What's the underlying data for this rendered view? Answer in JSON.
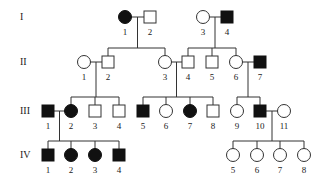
{
  "colors": {
    "affected": "#111111",
    "unaffected": "#ffffff",
    "line": "#333333"
  },
  "generations": [
    {
      "label": "I",
      "y": 17
    },
    {
      "label": "II",
      "y": 62
    },
    {
      "label": "III",
      "y": 111
    },
    {
      "label": "IV",
      "y": 155
    }
  ],
  "individuals": [
    {
      "id": "I-1",
      "num": "1",
      "gen": 0,
      "x": 125,
      "sex": "female",
      "affected": true
    },
    {
      "id": "I-2",
      "num": "2",
      "gen": 0,
      "x": 150,
      "sex": "male",
      "affected": false
    },
    {
      "id": "I-3",
      "num": "3",
      "gen": 0,
      "x": 203,
      "sex": "female",
      "affected": false
    },
    {
      "id": "I-4",
      "num": "4",
      "gen": 0,
      "x": 227,
      "sex": "male",
      "affected": true
    },
    {
      "id": "II-1",
      "num": "1",
      "gen": 1,
      "x": 84,
      "sex": "female",
      "affected": false
    },
    {
      "id": "II-2",
      "num": "2",
      "gen": 1,
      "x": 108,
      "sex": "male",
      "affected": false
    },
    {
      "id": "II-3",
      "num": "3",
      "gen": 1,
      "x": 165,
      "sex": "female",
      "affected": false
    },
    {
      "id": "II-4",
      "num": "4",
      "gen": 1,
      "x": 188,
      "sex": "male",
      "affected": false
    },
    {
      "id": "II-5",
      "num": "5",
      "gen": 1,
      "x": 212,
      "sex": "male",
      "affected": false
    },
    {
      "id": "II-6",
      "num": "6",
      "gen": 1,
      "x": 236,
      "sex": "female",
      "affected": false
    },
    {
      "id": "II-7",
      "num": "7",
      "gen": 1,
      "x": 260,
      "sex": "male",
      "affected": true
    },
    {
      "id": "III-1",
      "num": "1",
      "gen": 2,
      "x": 48,
      "sex": "male",
      "affected": true
    },
    {
      "id": "III-2",
      "num": "2",
      "gen": 2,
      "x": 71,
      "sex": "female",
      "affected": true
    },
    {
      "id": "III-3",
      "num": "3",
      "gen": 2,
      "x": 95,
      "sex": "male",
      "affected": false
    },
    {
      "id": "III-4",
      "num": "4",
      "gen": 2,
      "x": 119,
      "sex": "male",
      "affected": false
    },
    {
      "id": "III-5",
      "num": "5",
      "gen": 2,
      "x": 143,
      "sex": "male",
      "affected": true
    },
    {
      "id": "III-6",
      "num": "6",
      "gen": 2,
      "x": 166,
      "sex": "female",
      "affected": false
    },
    {
      "id": "III-7",
      "num": "7",
      "gen": 2,
      "x": 190,
      "sex": "female",
      "affected": true
    },
    {
      "id": "III-8",
      "num": "8",
      "gen": 2,
      "x": 213,
      "sex": "male",
      "affected": false
    },
    {
      "id": "III-9",
      "num": "9",
      "gen": 2,
      "x": 237,
      "sex": "female",
      "affected": false
    },
    {
      "id": "III-10",
      "num": "10",
      "gen": 2,
      "x": 260,
      "sex": "male",
      "affected": true
    },
    {
      "id": "III-11",
      "num": "11",
      "gen": 2,
      "x": 284,
      "sex": "female",
      "affected": false
    },
    {
      "id": "IV-1",
      "num": "1",
      "gen": 3,
      "x": 48,
      "sex": "male",
      "affected": true
    },
    {
      "id": "IV-2",
      "num": "2",
      "gen": 3,
      "x": 71,
      "sex": "female",
      "affected": true
    },
    {
      "id": "IV-3",
      "num": "3",
      "gen": 3,
      "x": 95,
      "sex": "female",
      "affected": true
    },
    {
      "id": "IV-4",
      "num": "4",
      "gen": 3,
      "x": 119,
      "sex": "male",
      "affected": true
    },
    {
      "id": "IV-5",
      "num": "5",
      "gen": 3,
      "x": 233,
      "sex": "female",
      "affected": false
    },
    {
      "id": "IV-6",
      "num": "6",
      "gen": 3,
      "x": 257,
      "sex": "female",
      "affected": false
    },
    {
      "id": "IV-7",
      "num": "7",
      "gen": 3,
      "x": 280,
      "sex": "female",
      "affected": false
    },
    {
      "id": "IV-8",
      "num": "8",
      "gen": 3,
      "x": 304,
      "sex": "female",
      "affected": false
    }
  ],
  "families": [
    {
      "parents": [
        "I-1",
        "I-2"
      ],
      "children": [
        "II-2",
        "II-3"
      ]
    },
    {
      "parents": [
        "I-3",
        "I-4"
      ],
      "children": [
        "II-4",
        "II-5",
        "II-6"
      ]
    },
    {
      "parents": [
        "II-1",
        "II-2"
      ],
      "children": [
        "III-2",
        "III-3",
        "III-4"
      ]
    },
    {
      "parents": [
        "II-3",
        "II-4"
      ],
      "children": [
        "III-5",
        "III-6",
        "III-7",
        "III-8"
      ]
    },
    {
      "parents": [
        "II-6",
        "II-7"
      ],
      "children": [
        "III-9",
        "III-10"
      ]
    },
    {
      "parents": [
        "III-1",
        "III-2"
      ],
      "children": [
        "IV-1",
        "IV-2",
        "IV-3",
        "IV-4"
      ]
    },
    {
      "parents": [
        "III-10",
        "III-11"
      ],
      "children": [
        "IV-5",
        "IV-6",
        "IV-7",
        "IV-8"
      ]
    }
  ]
}
